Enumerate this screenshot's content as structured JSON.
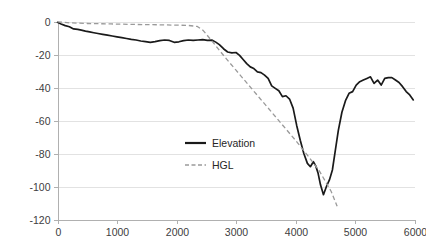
{
  "chart_data": {
    "type": "line",
    "title": "",
    "xlabel": "",
    "ylabel": "",
    "xlim": [
      0,
      6000
    ],
    "ylim": [
      -120,
      0
    ],
    "grid": true,
    "legend_position": "center",
    "x_ticks": [
      "0",
      "1000",
      "2000",
      "3000",
      "4000",
      "5000",
      "6000"
    ],
    "x_tick_values": [
      0,
      1000,
      2000,
      3000,
      4000,
      5000,
      6000
    ],
    "y_ticks": [
      "0",
      "-20",
      "-40",
      "-60",
      "-80",
      "-100",
      "-120"
    ],
    "y_tick_values": [
      0,
      -20,
      -40,
      -60,
      -80,
      -100,
      -120
    ],
    "series": [
      {
        "name": "Elevation",
        "style": "solid",
        "color": "#1a1a1a",
        "x": [
          0,
          60,
          130,
          200,
          270,
          340,
          400,
          470,
          540,
          610,
          680,
          760,
          840,
          920,
          1000,
          1080,
          1160,
          1240,
          1320,
          1400,
          1480,
          1560,
          1640,
          1720,
          1800,
          1880,
          1960,
          2040,
          2120,
          2200,
          2280,
          2360,
          2440,
          2520,
          2600,
          2660,
          2720,
          2790,
          2860,
          2930,
          3000,
          3060,
          3120,
          3180,
          3240,
          3300,
          3360,
          3420,
          3480,
          3540,
          3600,
          3660,
          3720,
          3780,
          3840,
          3900,
          3960,
          4020,
          4080,
          4140,
          4200,
          4250,
          4300,
          4340,
          4380,
          4420,
          4470,
          4520,
          4570,
          4620,
          4670,
          4720,
          4780,
          4840,
          4900,
          4960,
          5020,
          5080,
          5140,
          5200,
          5260,
          5320,
          5380,
          5440,
          5500,
          5560,
          5620,
          5680,
          5740,
          5800,
          5860,
          5920,
          5980
        ],
        "y": [
          -0.5,
          -1.5,
          -2.5,
          -3.2,
          -4.5,
          -4.8,
          -5.2,
          -5.8,
          -6.3,
          -6.8,
          -7.3,
          -7.8,
          -8.3,
          -8.8,
          -9.3,
          -9.8,
          -10.3,
          -10.8,
          -11.2,
          -11.8,
          -12.2,
          -12.6,
          -12.2,
          -11.6,
          -11.2,
          -11.5,
          -12.6,
          -12.3,
          -11.6,
          -11.2,
          -11.5,
          -11.2,
          -11.0,
          -11.4,
          -11.3,
          -12.5,
          -14.0,
          -16.5,
          -18.5,
          -19.0,
          -18.8,
          -20.5,
          -23.0,
          -25.5,
          -27.5,
          -28.5,
          -30.5,
          -31.0,
          -32.5,
          -34.5,
          -39.0,
          -40.5,
          -42.0,
          -45.5,
          -45.0,
          -47.0,
          -52.5,
          -63.0,
          -72.0,
          -80.0,
          -86.0,
          -88.0,
          -85.0,
          -87.5,
          -92.0,
          -99.0,
          -105.0,
          -100.0,
          -96.0,
          -90.0,
          -78.0,
          -66.0,
          -55.0,
          -48.0,
          -43.5,
          -42.5,
          -38.5,
          -36.5,
          -35.5,
          -34.5,
          -33.5,
          -37.5,
          -35.5,
          -38.5,
          -34.5,
          -34.0,
          -34.0,
          -35.5,
          -37.0,
          -39.5,
          -42.5,
          -44.5,
          -47.5
        ]
      },
      {
        "name": "HGL",
        "style": "dashed",
        "color": "#9a9a9a",
        "x": [
          0,
          200,
          500,
          900,
          1300,
          1700,
          2000,
          2200,
          2350,
          2450,
          2600,
          2800,
          3000,
          3200,
          3400,
          3600,
          3800,
          4000,
          4200,
          4400,
          4600,
          4700
        ],
        "y": [
          -0.2,
          -0.8,
          -1.2,
          -1.5,
          -1.8,
          -2.0,
          -2.2,
          -2.4,
          -3.0,
          -5.5,
          -12.0,
          -21.0,
          -29.5,
          -38.0,
          -46.5,
          -55.0,
          -63.5,
          -72.0,
          -81.0,
          -90.5,
          -103.0,
          -112.0
        ]
      }
    ]
  },
  "legend": {
    "entries": [
      {
        "label": "Elevation",
        "style": "solid"
      },
      {
        "label": "HGL",
        "style": "dashed"
      }
    ]
  }
}
